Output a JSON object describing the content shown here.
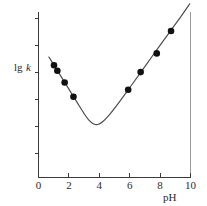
{
  "chart_data": {
    "type": "line",
    "title": "",
    "subtitle": "",
    "xlabel": "pH",
    "ylabel": "lgk",
    "ylabel_parts": {
      "prefix": "lg",
      "italic": "k"
    },
    "xlim": [
      0,
      10
    ],
    "ylim": [
      0,
      10
    ],
    "grid": false,
    "legend": null,
    "x_ticks": [
      0,
      2,
      4,
      6,
      8,
      10
    ],
    "x_tick_labels": [
      "0",
      "2",
      "4",
      "6",
      "8",
      "10"
    ],
    "y_ticks": [
      1.1,
      2.8,
      4.5,
      6.2,
      7.9,
      9.6
    ],
    "y_tick_labels": [
      "",
      "",
      "",
      "",
      "",
      ""
    ],
    "series": [
      {
        "name": "fitted curve",
        "kind": "line",
        "x": [
          0.68,
          1.0,
          1.5,
          2.0,
          2.5,
          3.0,
          3.3,
          3.6,
          3.9,
          4.2,
          4.6,
          5.2,
          5.9,
          6.7,
          7.4,
          8.1,
          8.7,
          9.4,
          9.95
        ],
        "y": [
          7.28,
          6.82,
          6.08,
          5.34,
          4.6,
          3.86,
          3.48,
          3.25,
          3.2,
          3.35,
          3.72,
          4.42,
          5.3,
          6.32,
          7.22,
          8.12,
          8.88,
          9.77,
          10.5
        ]
      },
      {
        "name": "measurements",
        "kind": "scatter",
        "marker": "filled-circle",
        "x": [
          1.02,
          1.24,
          1.72,
          2.3,
          5.9,
          6.72,
          7.78,
          8.72
        ],
        "y": [
          6.78,
          6.45,
          5.74,
          4.88,
          5.3,
          6.37,
          7.5,
          8.85
        ]
      }
    ]
  },
  "figure": {
    "background_color": "#ffffff",
    "curve_color": "#4a4a4a",
    "marker_color": "#111111",
    "axis_color": "#3a3a3a",
    "frame_color": "#9a9a9a"
  }
}
